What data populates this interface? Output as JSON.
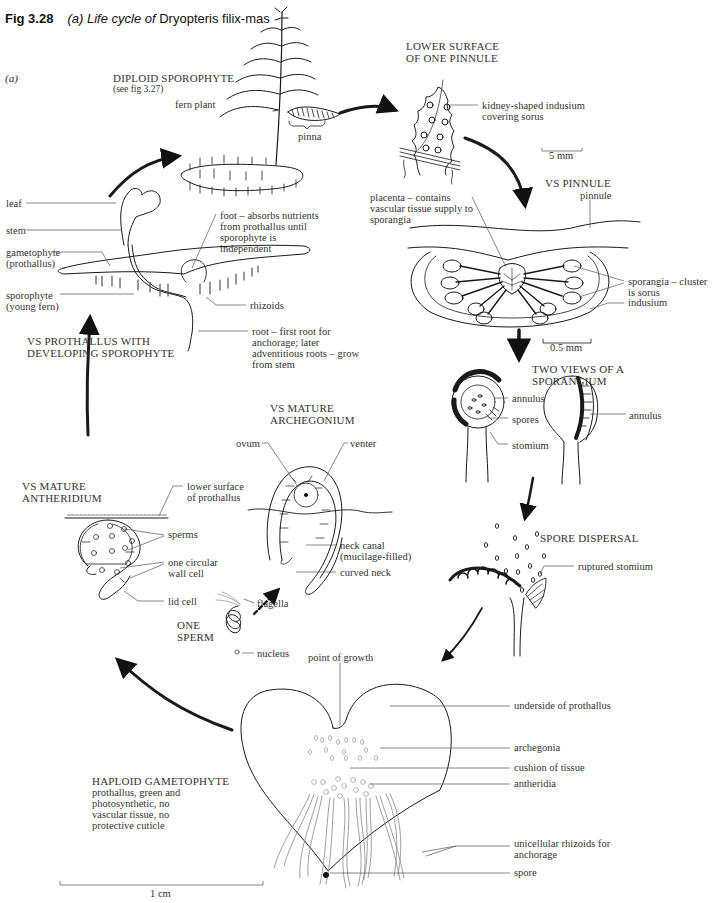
{
  "figure": {
    "number": "Fig 3.28",
    "title_italic": "(a) Life cycle of",
    "title_species": "Dryopteris filix-mas",
    "panel_label": "(a)"
  },
  "stages": {
    "diploid_sporophyte": {
      "heading": "DIPLOID SPOROPHYTE",
      "note": "(see fig 3.27)",
      "labels": [
        "fern plant",
        "pinna"
      ]
    },
    "lower_surface": {
      "heading": "LOWER SURFACE\nOF ONE PINNULE",
      "labels": [
        "kidney-shaped indusium\ncovering sorus"
      ],
      "scale": "5 mm"
    },
    "vs_pinnule": {
      "heading": "VS PINNULE",
      "labels": [
        "pinnule",
        "placenta – contains\nvascular tissue supply to\nsporangia",
        "sporangia – cluster\nis sorus",
        "indusium"
      ],
      "scale": "0.5 mm"
    },
    "sporangium": {
      "heading": "TWO VIEWS OF A\nSPORANGIUM",
      "labels": [
        "annulus",
        "spores",
        "stomium",
        "annulus"
      ]
    },
    "spore_dispersal": {
      "heading": "SPORE DISPERSAL",
      "labels": [
        "ruptured stomium"
      ]
    },
    "gametophyte": {
      "heading": "HAPLOID GAMETOPHYTE",
      "description": "prothallus, green and\nphotosynthetic, no\nvascular tissue, no\nprotective cuticle",
      "labels": [
        "point of growth",
        "underside of prothallus",
        "archegonia",
        "cushion of tissue",
        "antheridia",
        "unicellular rhizoids for\nanchorage",
        "spore"
      ],
      "scale": "1 cm"
    },
    "antheridium": {
      "heading": "VS MATURE\nANTHERIDIUM",
      "labels": [
        "lower surface\nof prothallus",
        "sperms",
        "one circular\nwall cell",
        "lid cell"
      ]
    },
    "sperm": {
      "heading": "ONE\nSPERM",
      "labels": [
        "flagella",
        "nucleus"
      ]
    },
    "archegonium": {
      "heading": "VS MATURE\nARCHEGONIUM",
      "labels": [
        "ovum",
        "venter",
        "neck canal\n(mucilage-filled)",
        "curved neck"
      ]
    },
    "prothallus_sporophyte": {
      "heading": "VS PROTHALLUS WITH\nDEVELOPING SPOROPHYTE",
      "labels": [
        "leaf",
        "stem",
        "gametophyte\n(prothallus)",
        "sporophyte\n(young fern)",
        "foot – absorbs nutrients\nfrom prothallus until\nsporophyte is\nindependent",
        "rhizoids",
        "root – first root for\nanchorage; later\nadventitious roots – grow\nfrom stem"
      ]
    }
  },
  "colors": {
    "ink": "#1a1a1a",
    "text": "#333333",
    "leader": "#555555",
    "background": "#ffffff"
  }
}
